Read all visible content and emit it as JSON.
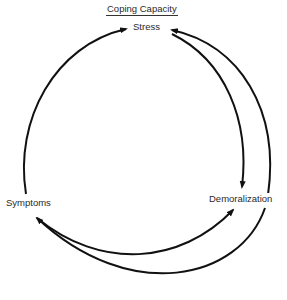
{
  "diagram": {
    "header_label": "Coping Capacity",
    "nodes": [
      {
        "id": "stress",
        "label": "Stress"
      },
      {
        "id": "symptoms",
        "label": "Symptoms"
      },
      {
        "id": "demoralization",
        "label": "Demoralization"
      }
    ],
    "edges": [
      {
        "from": "symptoms",
        "to": "stress"
      },
      {
        "from": "stress",
        "to": "demoralization"
      },
      {
        "from": "demoralization",
        "to": "stress"
      },
      {
        "from": "symptoms",
        "to": "demoralization"
      },
      {
        "from": "stress",
        "to": "symptoms"
      }
    ],
    "line_color": "#111111"
  }
}
